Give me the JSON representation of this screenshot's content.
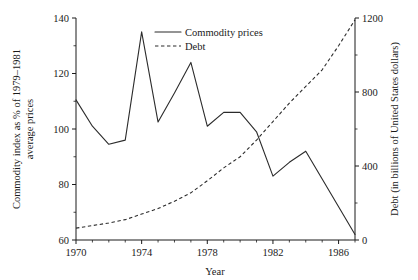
{
  "chart_data": {
    "type": "line",
    "title": "",
    "xlabel": "Year",
    "ylabel": "Commodity index as % of 1979–1981 average prices",
    "ylabel_right": "Debt (in billions of United States dollars)",
    "xlim": [
      1970,
      1987
    ],
    "ylim": [
      60,
      140
    ],
    "ylim_right": [
      0,
      1200
    ],
    "xticks": [
      1970,
      1974,
      1978,
      1982,
      1986
    ],
    "xtick_labels": [
      "1970",
      "1974",
      "1978",
      "1982",
      "1986"
    ],
    "xticks_minor": [
      1971,
      1972,
      1973,
      1975,
      1976,
      1977,
      1979,
      1980,
      1981,
      1983,
      1984,
      1985,
      1987
    ],
    "yticks": [
      60,
      80,
      100,
      120,
      140
    ],
    "ytick_labels": [
      "60",
      "80",
      "100",
      "120",
      "140"
    ],
    "yticks_minor": [
      70,
      90,
      110,
      130
    ],
    "yticks_right": [
      0,
      400,
      800,
      1200
    ],
    "ytick_labels_right": [
      "0",
      "400",
      "800",
      "1200"
    ],
    "yticks_right_minor": [
      200,
      600,
      1000
    ],
    "grid": false,
    "legend_position": "top-center",
    "x": [
      1970,
      1971,
      1972,
      1973,
      1974,
      1975,
      1976,
      1977,
      1978,
      1979,
      1980,
      1981,
      1982,
      1983,
      1984,
      1985,
      1986,
      1987
    ],
    "series": [
      {
        "name": "Commodity prices",
        "axis": "left",
        "style": "solid",
        "color": "#2b2b2b",
        "values": [
          110.5,
          101.0,
          94.5,
          96.0,
          135.0,
          102.5,
          113.0,
          124.0,
          101.0,
          106.0,
          106.0,
          99.0,
          83.0,
          88.0,
          92.0,
          82.0,
          72.0,
          62.0
        ]
      },
      {
        "name": "Debt",
        "axis": "right",
        "style": "dashed",
        "color": "#2b2b2b",
        "values": [
          64,
          78,
          92,
          110,
          140,
          170,
          210,
          255,
          320,
          390,
          450,
          540,
          640,
          740,
          830,
          920,
          1050,
          1190
        ]
      }
    ],
    "legend": [
      {
        "label": "Commodity prices",
        "style": "solid"
      },
      {
        "label": "Debt",
        "style": "dashed"
      }
    ]
  }
}
